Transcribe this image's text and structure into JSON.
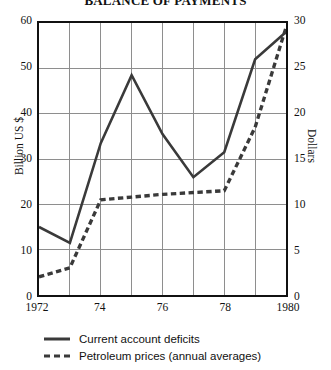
{
  "chart_data": {
    "type": "line",
    "title": "BALANCE OF PAYMENTS",
    "xlabel": "",
    "ylabel": "Billion US $",
    "y2label": "Dollars",
    "x": [
      1972,
      1973,
      1974,
      1975,
      1976,
      1977,
      1978,
      1979,
      1980
    ],
    "xtick_values": [
      1972,
      1974,
      1976,
      1978,
      1980
    ],
    "xtick_labels": [
      "1972",
      "74",
      "76",
      "78",
      "1980"
    ],
    "xlim": [
      1972,
      1980
    ],
    "ylim": [
      0,
      60
    ],
    "ytick_labels": [
      "0",
      "10",
      "20",
      "30",
      "40",
      "50",
      "60"
    ],
    "ytick_values": [
      0,
      10,
      20,
      30,
      40,
      50,
      60
    ],
    "y2lim": [
      0,
      30
    ],
    "y2tick_labels": [
      "0",
      "5",
      "10",
      "15",
      "20",
      "25",
      "30"
    ],
    "y2tick_values": [
      0,
      5,
      10,
      15,
      20,
      25,
      30
    ],
    "grid": true,
    "legend_position": "below",
    "series": [
      {
        "name": "Current account deficits",
        "axis": "left",
        "style": "solid",
        "color": "#3a3a3a",
        "values": [
          15.0,
          11.5,
          33.5,
          48.5,
          35.5,
          26.0,
          31.5,
          52.0,
          58.0
        ]
      },
      {
        "name": "Petroleum prices (annual averages)",
        "axis": "right",
        "style": "dashed",
        "color": "#3a3a3a",
        "values": [
          2.0,
          3.0,
          10.5,
          10.8,
          11.1,
          11.3,
          11.5,
          18.5,
          29.5
        ]
      }
    ]
  },
  "legend": {
    "items": [
      {
        "label": "Current account deficits",
        "style": "solid"
      },
      {
        "label": "Petroleum prices (annual averages)",
        "style": "dashed"
      }
    ]
  }
}
